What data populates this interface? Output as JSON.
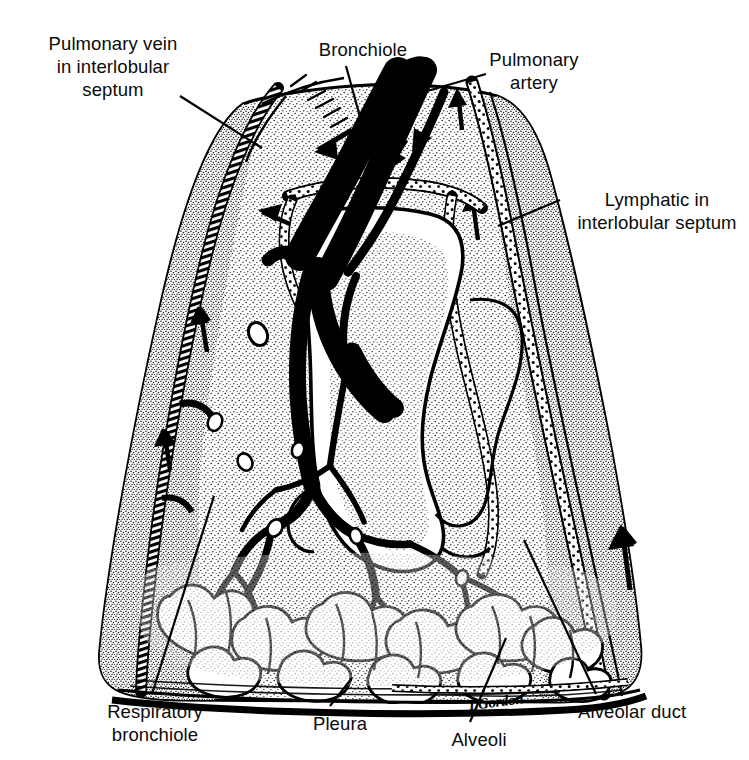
{
  "figure": {
    "medium": "black-and-white stippled pen-and-ink anatomical illustration",
    "background_color": "#ffffff",
    "ink_color": "#000000",
    "signature": "I.Gordon"
  },
  "labels": {
    "pulmonary_vein": "Pulmonary vein\nin interlobular\nseptum",
    "bronchiole": "Bronchiole",
    "pulmonary_artery": "Pulmonary\nartery",
    "lymphatic": "Lymphatic in\ninterlobular septum",
    "respiratory_bronchiole": "Respiratory\nbronchiole",
    "pleura": "Pleura",
    "alveoli": "Alveoli",
    "alveolar_duct": "Alveolar duct"
  }
}
